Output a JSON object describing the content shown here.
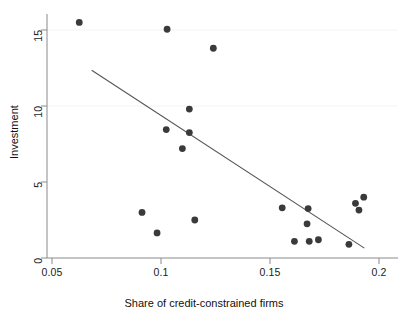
{
  "chart_data": {
    "type": "scatter",
    "title": "",
    "xlabel": "Share of credit-constrained firms",
    "ylabel": "Investment",
    "xlim": [
      0.045,
      0.205
    ],
    "ylim": [
      -0.6,
      16.3
    ],
    "xticks": [
      0.05,
      0.1,
      0.15,
      0.2
    ],
    "xtick_labels": [
      "0.05",
      "0.1",
      "0.15",
      "0.2"
    ],
    "yticks": [
      0,
      5,
      10,
      15
    ],
    "ytick_labels": [
      "0",
      "5",
      "10",
      "15"
    ],
    "grid": false,
    "legend": null,
    "marker_color": "#3a3a3a",
    "line_color": "#555555",
    "axis_color": "#8a8a8a",
    "points": [
      {
        "x": 0.0625,
        "y": 15.5
      },
      {
        "x": 0.1028,
        "y": 15.05
      },
      {
        "x": 0.124,
        "y": 13.8
      },
      {
        "x": 0.113,
        "y": 9.8
      },
      {
        "x": 0.1024,
        "y": 8.45
      },
      {
        "x": 0.113,
        "y": 8.25
      },
      {
        "x": 0.1098,
        "y": 7.2
      },
      {
        "x": 0.0913,
        "y": 3.0
      },
      {
        "x": 0.1155,
        "y": 2.5
      },
      {
        "x": 0.0982,
        "y": 1.65
      },
      {
        "x": 0.1556,
        "y": 3.3
      },
      {
        "x": 0.1675,
        "y": 3.25
      },
      {
        "x": 0.167,
        "y": 2.25
      },
      {
        "x": 0.1612,
        "y": 1.1
      },
      {
        "x": 0.168,
        "y": 1.1
      },
      {
        "x": 0.1722,
        "y": 1.2
      },
      {
        "x": 0.1892,
        "y": 3.6
      },
      {
        "x": 0.193,
        "y": 4.0
      },
      {
        "x": 0.1908,
        "y": 3.15
      },
      {
        "x": 0.1862,
        "y": 0.9
      }
    ],
    "fit_line": {
      "x_start": 0.0682,
      "y_start": 12.35,
      "x_end": 0.1933,
      "y_end": 0.65
    }
  },
  "axes": {
    "x_tick_0": "0.05",
    "x_tick_1": "0.1",
    "x_tick_2": "0.15",
    "x_tick_3": "0.2",
    "y_tick_0": "0",
    "y_tick_1": "5",
    "y_tick_2": "10",
    "y_tick_3": "15",
    "x_axis_title": "Share of credit-constrained firms",
    "y_axis_title": "Investment"
  }
}
